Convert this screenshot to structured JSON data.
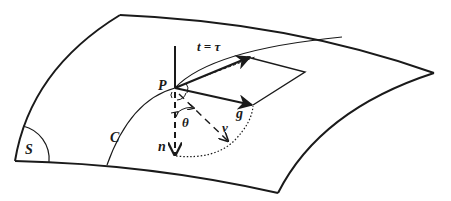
{
  "figure": {
    "colors": {
      "ink": "#1a1a1a",
      "background": "#ffffff"
    },
    "labels": {
      "surface": "S",
      "curve": "C",
      "point": "P",
      "tangent": "t = τ",
      "geodesic_normal": "g",
      "surface_normal": "n",
      "principal_normal": "ν",
      "angle": "θ"
    }
  }
}
